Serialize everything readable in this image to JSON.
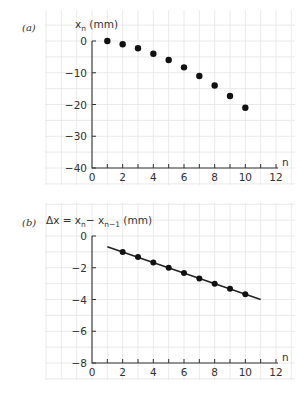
{
  "chart_data": [
    {
      "panel_label": "(a)",
      "type": "scatter",
      "title": "",
      "xlabel": "n",
      "ylabel": "x_n (mm)",
      "ylabel_main": "x",
      "ylabel_sub": "n",
      "ylabel_unit": " (mm)",
      "xlim": [
        0,
        12
      ],
      "ylim": [
        -40,
        0
      ],
      "xticks": [
        0,
        2,
        4,
        6,
        8,
        10,
        12
      ],
      "yticks": [
        0,
        -10,
        -20,
        -30,
        -40
      ],
      "ytick_labels": [
        "0",
        "−10",
        "−20",
        "−30",
        "−40"
      ],
      "grid": true,
      "series": [
        {
          "name": "x_n",
          "x": [
            1,
            2,
            3,
            4,
            5,
            6,
            7,
            8,
            9,
            10
          ],
          "y": [
            0,
            -1,
            -2.3,
            -4,
            -6,
            -8.3,
            -11,
            -14,
            -17.3,
            -21
          ]
        }
      ]
    },
    {
      "panel_label": "(b)",
      "type": "line",
      "title": "",
      "xlabel": "n",
      "ylabel": "Δx = x_n − x_(n−1) (mm)",
      "ylabel_parts": {
        "delta": "Δx = x",
        "sub1": "n",
        "minus": "− x",
        "sub2": "n−1",
        "unit": " (mm)"
      },
      "xlim": [
        0,
        12
      ],
      "ylim": [
        -8,
        0
      ],
      "xticks": [
        0,
        2,
        4,
        6,
        8,
        10,
        12
      ],
      "yticks": [
        0,
        -2,
        -4,
        -6,
        -8
      ],
      "ytick_labels": [
        "0",
        "−2",
        "−4",
        "−6",
        "−8"
      ],
      "grid": true,
      "series": [
        {
          "name": "Δx",
          "x": [
            2,
            3,
            4,
            5,
            6,
            7,
            8,
            9,
            10
          ],
          "y": [
            -1,
            -1.33,
            -1.67,
            -2,
            -2.33,
            -2.67,
            -3,
            -3.33,
            -3.67
          ]
        }
      ],
      "fit_line": {
        "x": [
          1,
          11
        ],
        "y": [
          -0.67,
          -4.0
        ]
      }
    }
  ]
}
